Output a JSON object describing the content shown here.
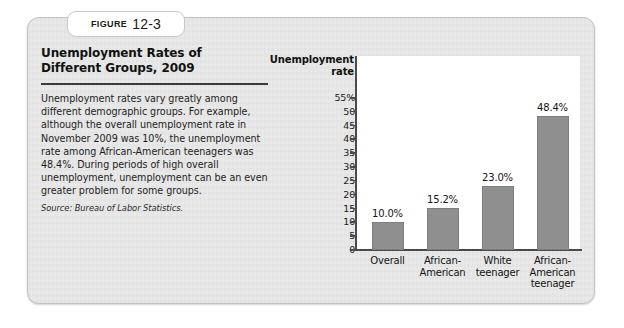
{
  "figure": {
    "tab_word": "Figure",
    "tab_number": "12-3",
    "title": "Unemployment Rates of Different Groups, 2009",
    "body": "Unemployment rates vary greatly among different demographic groups. For example, although the overall unemployment rate in November 2009 was 10%, the unemployment rate among African-American teenagers was 48.4%. During periods of high overall unemployment, unemployment can be an even greater problem for some groups.",
    "source": "Source: Bureau of Labor Statistics."
  },
  "colors": {
    "bar": "#8f8f8f",
    "card_background": "#e9e9e9",
    "plot_background": "#ffffff",
    "axis": "#4a4a4a",
    "text": "#141414"
  },
  "chart_data": {
    "type": "bar",
    "title": "Unemployment Rates of Different Groups, 2009",
    "xlabel": "",
    "ylabel": "Unemployment rate",
    "ylabel_lines": [
      "Unemployment",
      "rate"
    ],
    "categories": [
      "Overall",
      "African-American",
      "White teenager",
      "African-American teenager"
    ],
    "category_label_lines": [
      [
        "Overall"
      ],
      [
        "African-",
        "American"
      ],
      [
        "White",
        "teenager"
      ],
      [
        "African-",
        "American",
        "teenager"
      ]
    ],
    "values": [
      10.0,
      15.2,
      23.0,
      48.4
    ],
    "value_labels": [
      "10.0%",
      "15.2%",
      "23.0%",
      "48.4%"
    ],
    "ylim": [
      0,
      55
    ],
    "ytick_values": [
      55,
      50,
      45,
      40,
      35,
      30,
      25,
      20,
      15,
      10,
      5,
      0
    ],
    "ytick_labels": [
      "55%",
      "50",
      "45",
      "40",
      "35",
      "30",
      "25",
      "20",
      "15",
      "10",
      "5",
      "0"
    ],
    "grid": false,
    "legend": false
  }
}
